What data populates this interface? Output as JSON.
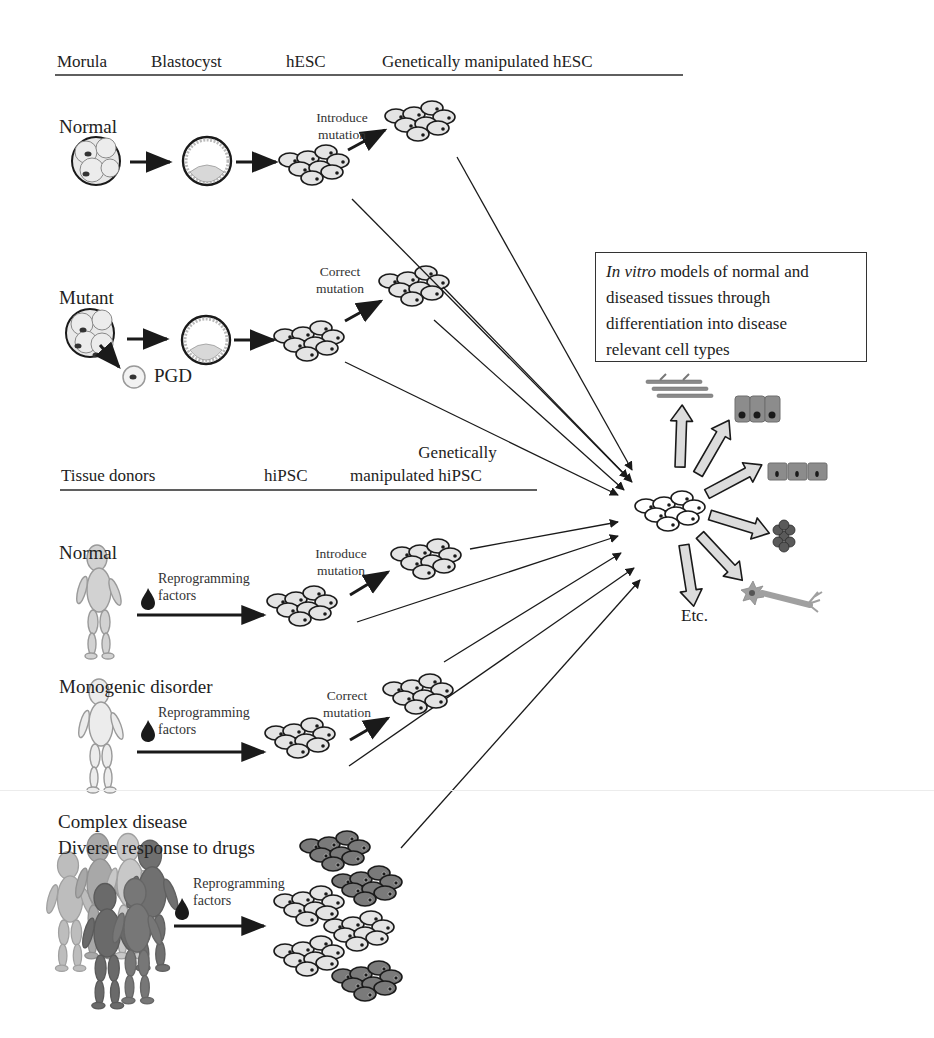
{
  "page": {
    "running_header_fragment": "g                                        gy"
  },
  "hesc_section": {
    "headers": [
      "Morula",
      "Blastocyst",
      "hESC",
      "Genetically manipulated hESC"
    ],
    "rows": [
      {
        "label": "Normal",
        "manipulation": [
          "Introduce",
          "mutation"
        ]
      },
      {
        "label": "Mutant",
        "manipulation": [
          "Correct",
          "mutation"
        ],
        "extra_label": "PGD"
      }
    ]
  },
  "outcome_box": {
    "italic_prefix": "In vitro",
    "line1_rest": " models of normal and",
    "line2": "diseased tissues through",
    "line3": "differentiation into disease",
    "line4": "relevant cell types"
  },
  "differentiation": {
    "cell_types": [
      "muscle-fibers",
      "columnar-epithelium",
      "cuboidal-epithelium",
      "hexagonal-cells",
      "neuron"
    ],
    "etc_label": "Etc."
  },
  "hipsc_section": {
    "headers": [
      "Tissue donors",
      "hiPSC",
      "Genetically",
      "manipulated hiPSC"
    ],
    "rows": [
      {
        "label": "Normal",
        "reprogramming": [
          "Reprogramming",
          "factors"
        ],
        "manipulation": [
          "Introduce",
          "mutation"
        ]
      },
      {
        "label": "Monogenic disorder",
        "reprogramming": [
          "Reprogramming",
          "factors"
        ],
        "manipulation": [
          "Correct",
          "mutation"
        ]
      },
      {
        "label": [
          "Complex disease",
          "Diverse response to drugs"
        ],
        "reprogramming": [
          "Reprogramming",
          "factors"
        ]
      }
    ]
  },
  "colors": {
    "ink": "#1a1a1a",
    "cell_fill_light": "#e4e4e4",
    "cell_fill_dark": "#7a7a7a",
    "block_arrow_fill": "#dcdcdc",
    "figure_gray": "#b8b8b8"
  }
}
